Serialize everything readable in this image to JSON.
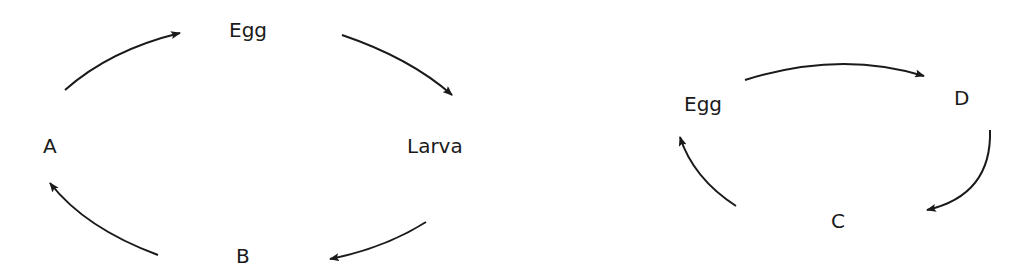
{
  "diagrams": [
    {
      "name": "life-cycle-1",
      "stages": {
        "egg": "Egg",
        "larva": "Larva",
        "b": "B",
        "a": "A"
      }
    },
    {
      "name": "life-cycle-2",
      "stages": {
        "egg": "Egg",
        "d": "D",
        "c": "C"
      }
    }
  ],
  "colors": {
    "ink": "#1a1a1a",
    "background": "#ffffff"
  }
}
